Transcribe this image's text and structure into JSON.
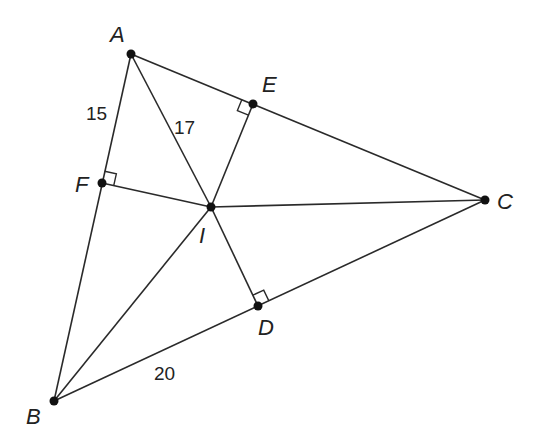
{
  "diagram": {
    "points": [
      {
        "name": "A",
        "x": 131,
        "y": 54,
        "label_x": 110,
        "label_y": 42
      },
      {
        "name": "B",
        "x": 54,
        "y": 401,
        "label_x": 26,
        "label_y": 424
      },
      {
        "name": "C",
        "x": 485,
        "y": 200,
        "label_x": 497,
        "label_y": 209
      },
      {
        "name": "D",
        "x": 258,
        "y": 306,
        "label_x": 258,
        "label_y": 335
      },
      {
        "name": "E",
        "x": 253,
        "y": 104,
        "label_x": 262,
        "label_y": 92
      },
      {
        "name": "F",
        "x": 102,
        "y": 183,
        "label_x": 75,
        "label_y": 192
      },
      {
        "name": "I",
        "x": 211,
        "y": 207,
        "label_x": 199,
        "label_y": 243
      }
    ],
    "segments": [
      [
        "A",
        "B"
      ],
      [
        "B",
        "C"
      ],
      [
        "C",
        "A"
      ],
      [
        "A",
        "I"
      ],
      [
        "B",
        "I"
      ],
      [
        "C",
        "I"
      ],
      [
        "I",
        "D"
      ],
      [
        "I",
        "E"
      ],
      [
        "I",
        "F"
      ]
    ],
    "right_angles": [
      "D",
      "E",
      "F"
    ],
    "measurements": [
      {
        "segment": "AF",
        "value": "15",
        "x": 86,
        "y": 120
      },
      {
        "segment": "AI",
        "value": "17",
        "x": 174,
        "y": 134
      },
      {
        "segment": "BD",
        "value": "20",
        "x": 154,
        "y": 380
      }
    ]
  }
}
